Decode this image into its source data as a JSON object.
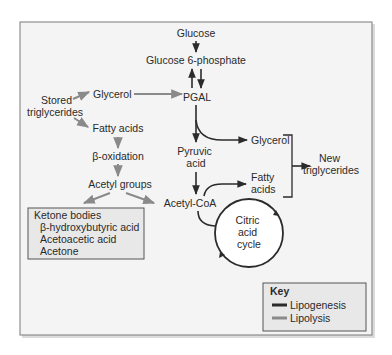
{
  "diagram": {
    "nodes": {
      "glucose": "Glucose",
      "glucose6p": "Glucose 6-phosphate",
      "pgal": "PGAL",
      "glycerol_left": "Glycerol",
      "stored_tg_line1": "Stored",
      "stored_tg_line2": "triglycerides",
      "fatty_acids_left": "Fatty acids",
      "beta_oxidation": "β-oxidation",
      "acetyl_groups": "Acetyl groups",
      "pyruvic_line1": "Pyruvic",
      "pyruvic_line2": "acid",
      "acetyl_coa": "Acetyl-CoA",
      "glycerol_right": "Glycerol",
      "fatty_acids_right_line1": "Fatty",
      "fatty_acids_right_line2": "acids",
      "new_tg_line1": "New",
      "new_tg_line2": "triglycerides",
      "citric_line1": "Citric",
      "citric_line2": "acid",
      "citric_line3": "cycle"
    },
    "ketone_box": {
      "title": "Ketone bodies",
      "items": [
        "β-hydroxybutyric acid",
        "Acetoacetic acid",
        "Acetone"
      ]
    },
    "key": {
      "title": "Key",
      "entries": [
        {
          "label": "Lipogenesis",
          "color": "#2b2b2b"
        },
        {
          "label": "Lipolysis",
          "color": "#8a8a8a"
        }
      ]
    },
    "colors": {
      "frame_bg": "#f4f4f4",
      "box_bg": "#e8e8e8",
      "lipogenesis": "#2b2b2b",
      "lipolysis": "#8a8a8a"
    }
  }
}
